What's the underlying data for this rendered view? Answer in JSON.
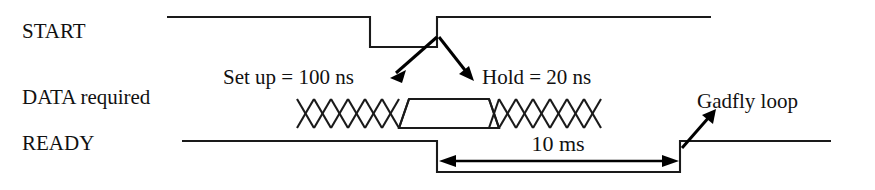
{
  "figure": {
    "type": "timing-diagram",
    "background_color": "#ffffff",
    "line_color": "#1a1a1a",
    "width": 875,
    "height": 190
  },
  "signals": [
    {
      "name": "start",
      "label": "START",
      "label_x": 22,
      "label_y": 33,
      "row_high_y": 17,
      "row_low_y": 47,
      "segments": [
        {
          "state": "high",
          "x_start": 167,
          "x_end": 370
        },
        {
          "state": "low",
          "x_start": 370,
          "x_end": 437
        },
        {
          "state": "high",
          "x_start": 437,
          "x_end": 711
        }
      ]
    },
    {
      "name": "data-required",
      "label": "DATA required",
      "label_x": 22,
      "label_y": 99,
      "row_high_y": 99,
      "row_low_y": 128,
      "hatch_regions": [
        {
          "x_start": 297,
          "x_end": 400
        },
        {
          "x_start": 498,
          "x_end": 605
        }
      ],
      "valid_region": {
        "x_start": 400,
        "x_end": 498,
        "label": ""
      }
    },
    {
      "name": "ready",
      "label": "READY",
      "label_x": 22,
      "label_y": 145,
      "row_high_y": 141,
      "row_low_y": 172,
      "segments": [
        {
          "state": "high",
          "x_start": 182,
          "x_end": 437
        },
        {
          "state": "low",
          "x_start": 437,
          "x_end": 680
        },
        {
          "state": "high",
          "x_start": 680,
          "x_end": 831
        }
      ]
    }
  ],
  "annotations": [
    {
      "name": "setup-time",
      "text": "Set up = 100 ns",
      "text_x": 223,
      "text_y": 79,
      "arrow_from_x": 437,
      "arrow_from_y": 37,
      "arrow_to_x": 392,
      "arrow_to_y": 76
    },
    {
      "name": "hold-time",
      "text": "Hold = 20 ns",
      "text_x": 482,
      "text_y": 79,
      "arrow_from_x": 438,
      "arrow_from_y": 37,
      "arrow_to_x": 474,
      "arrow_to_y": 78
    },
    {
      "name": "gadfly-loop",
      "text": "Gadfly loop",
      "text_x": 697,
      "text_y": 103,
      "arrow_from_x": 682,
      "arrow_from_y": 148,
      "arrow_to_x": 714,
      "arrow_to_y": 112
    }
  ],
  "measurements": [
    {
      "name": "ten-ms-span",
      "label": "10 ms",
      "label_x": 558,
      "label_y": 146,
      "arrow_y": 161,
      "x_start": 440,
      "x_end": 678,
      "double_headed": true
    }
  ]
}
